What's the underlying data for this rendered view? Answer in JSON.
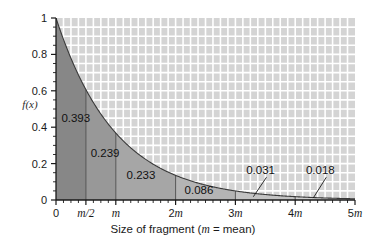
{
  "chart_data": {
    "type": "area",
    "title": "",
    "subtitle": "",
    "xlabel_prefix": "Size of fragment (",
    "xlabel_italic": "m",
    "xlabel_suffix": " = mean)",
    "ylabel": "f(x)",
    "xlim": [
      0,
      5
    ],
    "ylim": [
      0,
      1
    ],
    "grid": true,
    "legend": "none",
    "function": "f(x) = e^(-x/m)",
    "x_tick_labels": [
      "0",
      "m/2",
      "m",
      "2m",
      "3m",
      "4m",
      "5m"
    ],
    "x_tick_values": [
      0,
      0.5,
      1,
      2,
      3,
      4,
      5
    ],
    "x_tick_plain": [
      "0",
      "",
      "",
      "2",
      "3",
      "4",
      "5"
    ],
    "x_tick_italic": [
      "",
      "m/2",
      "m",
      "m",
      "m",
      "m",
      "m"
    ],
    "y_tick_labels": [
      "0",
      "0.2",
      "0.4",
      "0.6",
      "0.8",
      "1"
    ],
    "y_tick_values": [
      0,
      0.2,
      0.4,
      0.6,
      0.8,
      1
    ],
    "x_minor_step": 0.125,
    "y_minor_step": 0.05,
    "curve_points_x": [
      0,
      0.1,
      0.2,
      0.3,
      0.4,
      0.5,
      0.6,
      0.7,
      0.8,
      0.9,
      1.0,
      1.2,
      1.4,
      1.6,
      1.8,
      2.0,
      2.25,
      2.5,
      2.75,
      3.0,
      3.5,
      4.0,
      4.5,
      5.0
    ],
    "curve_points_y": [
      1.0,
      0.905,
      0.819,
      0.741,
      0.67,
      0.607,
      0.549,
      0.497,
      0.449,
      0.407,
      0.368,
      0.301,
      0.247,
      0.202,
      0.165,
      0.135,
      0.105,
      0.082,
      0.064,
      0.05,
      0.03,
      0.018,
      0.011,
      0.0067
    ],
    "bands": [
      {
        "label": "0.393",
        "x_start": 0,
        "x_end": 0.5,
        "value": 0.393,
        "shade": "#878787",
        "label_x": 0.09,
        "label_y": 0.43
      },
      {
        "label": "0.239",
        "x_start": 0.5,
        "x_end": 1.0,
        "value": 0.239,
        "shade": "#989898",
        "label_x": 0.58,
        "label_y": 0.235
      },
      {
        "label": "0.233",
        "x_start": 1.0,
        "x_end": 2.0,
        "value": 0.233,
        "shade": "#a6a6a6",
        "label_x": 1.18,
        "label_y": 0.115
      },
      {
        "label": "0.086",
        "x_start": 2.0,
        "x_end": 3.0,
        "value": 0.086,
        "shade": "#b4b4b4",
        "label_x": 2.15,
        "label_y": 0.035
      },
      {
        "label": "0.031",
        "x_start": 3.0,
        "x_end": 4.0,
        "value": 0.031,
        "shade": "#c3c3c3",
        "label_x": 3.18,
        "label_y": 0.145
      },
      {
        "label": "0.018",
        "x_start": 4.0,
        "x_end": 5.0,
        "value": 0.018,
        "shade": "#d0d0d0",
        "label_x": 4.18,
        "label_y": 0.145
      }
    ],
    "leaders": [
      {
        "for": "0.031",
        "from_x": 3.52,
        "from_y": 0.125,
        "to_x": 3.3,
        "to_y": 0.018
      },
      {
        "for": "0.018",
        "from_x": 4.52,
        "from_y": 0.125,
        "to_x": 4.3,
        "to_y": 0.01
      }
    ],
    "colors": {
      "grid_cell": "#d4d4d4",
      "gridline": "#ffffff",
      "curve": "#3a3a3a",
      "axis": "#1a1a1a",
      "plot_background": "#d4d4d4",
      "page_background": "#ffffff"
    }
  }
}
